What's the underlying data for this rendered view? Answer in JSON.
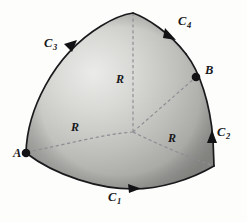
{
  "figure": {
    "background_color": "#fdfdfc",
    "surface_fill_light": "#e8e8e6",
    "surface_fill_mid": "#b9b9b6",
    "surface_fill_dark": "#8e8e8b",
    "boundary_color": "#1a1a1c",
    "dashed_color": "#8d8d93",
    "label_color": "#17171a"
  },
  "points": [
    {
      "id": "A",
      "label": "A",
      "x": 26,
      "y": 153,
      "label_x": 13,
      "label_y": 157
    },
    {
      "id": "B",
      "label": "B",
      "x": 196,
      "y": 77,
      "label_x": 205,
      "label_y": 74
    }
  ],
  "curves": [
    {
      "id": "C1",
      "base": "C",
      "subscript": "1",
      "label": "C₁",
      "label_x": 108,
      "label_y": 201,
      "arrow_x": 134,
      "arrow_y": 188,
      "arrow_direction": "right"
    },
    {
      "id": "C2",
      "base": "C",
      "subscript": "2",
      "label": "C₂",
      "label_x": 217,
      "label_y": 136,
      "arrow_x": 212,
      "arrow_y": 137,
      "arrow_direction": "up"
    },
    {
      "id": "C3",
      "base": "C",
      "subscript": "3",
      "label": "C₃",
      "label_x": 44,
      "label_y": 47,
      "arrow_x": 72,
      "arrow_y": 45,
      "arrow_direction": "up-right"
    },
    {
      "id": "C4",
      "base": "C",
      "subscript": "4",
      "label": "C₄",
      "label_x": 178,
      "label_y": 25,
      "arrow_x": 171,
      "arrow_y": 35,
      "arrow_direction": "down-right"
    }
  ],
  "radii": [
    {
      "id": "R-top",
      "label": "R",
      "label_x": 116,
      "label_y": 83,
      "from_x": 133,
      "from_y": 132,
      "to_x": 133,
      "to_y": 13
    },
    {
      "id": "R-left",
      "label": "R",
      "label_x": 71,
      "label_y": 131,
      "from_x": 133,
      "from_y": 132,
      "to_x": 27,
      "to_y": 152
    },
    {
      "id": "R-right",
      "label": "R",
      "label_x": 168,
      "label_y": 142,
      "from_x": 133,
      "from_y": 132,
      "to_x": 214,
      "to_y": 166
    }
  ],
  "hidden_radii": [
    {
      "id": "R-to-B",
      "from_x": 133,
      "from_y": 132,
      "to_x": 196,
      "to_y": 77
    }
  ],
  "center": {
    "x": 133,
    "y": 132
  }
}
